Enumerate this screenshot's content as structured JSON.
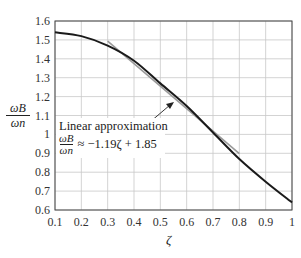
{
  "chart_data": {
    "type": "line",
    "title": "",
    "xlabel": "ζ",
    "ylabel": {
      "numerator": "ωB",
      "denominator": "ωn",
      "text": "ωB/ωn"
    },
    "xlim": [
      0.1,
      1.0
    ],
    "ylim": [
      0.6,
      1.6
    ],
    "grid": true,
    "x_ticks": [
      "0.1",
      "0.2",
      "0.3",
      "0.4",
      "0.5",
      "0.6",
      "0.7",
      "0.8",
      "0.9",
      "1"
    ],
    "y_ticks": [
      "0.6",
      "0.7",
      "0.8",
      "0.9",
      "1",
      "1.1",
      "1.2",
      "1.3",
      "1.4",
      "1.5",
      "1.6"
    ],
    "series": [
      {
        "name": "ωB/ωn (exact)",
        "color": "#1a1a1a",
        "x": [
          0.1,
          0.2,
          0.3,
          0.4,
          0.5,
          0.6,
          0.7,
          0.8,
          0.9,
          1.0
        ],
        "values": [
          1.54,
          1.52,
          1.47,
          1.39,
          1.27,
          1.15,
          1.01,
          0.87,
          0.75,
          0.64
        ]
      },
      {
        "name": "Linear approximation",
        "color": "#9a9a9a",
        "x": [
          0.3,
          0.8
        ],
        "values": [
          1.493,
          0.898
        ],
        "equation": "ωB/ωn ≈ −1.19ζ + 1.85"
      }
    ],
    "annotations": [
      {
        "text": "Linear approximation",
        "equation_lhs_num": "ωB",
        "equation_lhs_den": "ωn",
        "equation_rhs": "≈ −1.19ζ + 1.85",
        "arrow_to": [
          0.55,
          1.22
        ]
      }
    ]
  },
  "labels": {
    "annotation_title": "Linear approximation",
    "annotation_num": "ωB",
    "annotation_den": "ωn",
    "annotation_rhs": "≈ −1.19ζ + 1.85",
    "ylabel_num": "ωB",
    "ylabel_den": "ωn",
    "xlabel": "ζ"
  }
}
